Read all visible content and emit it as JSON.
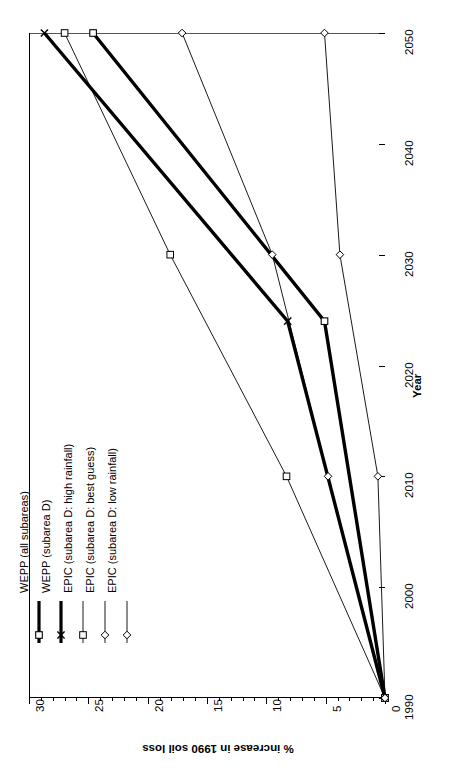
{
  "chart_data": {
    "type": "line",
    "title": "",
    "xlabel": "Year",
    "ylabel": "% increase in 1990 soil loss",
    "orientation": "rotated-90-ccw",
    "xlim": [
      1990,
      2050
    ],
    "ylim": [
      0,
      30
    ],
    "xticks": [
      1990,
      2000,
      2010,
      2020,
      2030,
      2040,
      2050
    ],
    "yticks": [
      0,
      5,
      10,
      15,
      20,
      25,
      30
    ],
    "grid": false,
    "legend_position": "left-inside",
    "series": [
      {
        "name": "WEPP (all subareas)",
        "marker": "square",
        "line": "thick",
        "x": [
          1990,
          2024,
          2050
        ],
        "values": [
          0,
          5.1,
          24.6
        ]
      },
      {
        "name": "WEPP (subarea D)",
        "marker": "x",
        "line": "thick",
        "x": [
          1990,
          2024,
          2050
        ],
        "values": [
          0,
          8.2,
          28.7
        ]
      },
      {
        "name": "EPIC (subarea D: high rainfall)",
        "marker": "square",
        "line": "thin",
        "x": [
          1990,
          2010,
          2030,
          2050
        ],
        "values": [
          0,
          8.3,
          18.1,
          27.0
        ]
      },
      {
        "name": "EPIC (subarea D: best guess)",
        "marker": "diamond",
        "line": "thin",
        "x": [
          1990,
          2010,
          2030,
          2050
        ],
        "values": [
          0,
          4.8,
          9.5,
          17.1
        ]
      },
      {
        "name": "EPIC (subarea D: low rainfall)",
        "marker": "diamond",
        "line": "thin",
        "x": [
          1990,
          2010,
          2030,
          2050
        ],
        "values": [
          0,
          0.6,
          3.8,
          5.1
        ]
      }
    ]
  },
  "axes": {
    "x_title": "Year",
    "y_title": "% increase in 1990 soil loss",
    "x_tick_labels": [
      "1990",
      "2000",
      "2010",
      "2020",
      "2030",
      "2040",
      "2050"
    ],
    "y_tick_labels": [
      "0",
      "5",
      "10",
      "15",
      "20",
      "25",
      "30"
    ]
  },
  "legend": {
    "items": [
      {
        "label": "WEPP (all subareas)",
        "marker": "square-marker",
        "weight": "thick"
      },
      {
        "label": "WEPP (subarea D)",
        "marker": "x-marker",
        "weight": "thick"
      },
      {
        "label": "EPIC (subarea D: high rainfall)",
        "marker": "square-marker",
        "weight": "thin"
      },
      {
        "label": "EPIC (subarea D: best guess)",
        "marker": "diamond-marker",
        "weight": "thin"
      },
      {
        "label": "EPIC (subarea D: low rainfall)",
        "marker": "diamond-marker",
        "weight": "thin"
      }
    ]
  },
  "colors": {
    "line": "#000000",
    "axis": "#000000",
    "background": "#ffffff",
    "marker_fill": "#ffffff"
  }
}
